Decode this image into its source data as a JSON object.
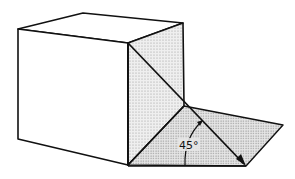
{
  "diagram": {
    "type": "isometric-cube-with-shadow-plane",
    "angle_label": "45°",
    "colors": {
      "stroke": "#111111",
      "face_white": "#ffffff",
      "face_shaded": "#e2e2e2",
      "ground_shaded": "#d6d6d6"
    },
    "vertices": {
      "front_top_left": [
        18,
        29
      ],
      "back_top_left": [
        83,
        13
      ],
      "back_top_right": [
        183,
        23
      ],
      "front_top_right": [
        128,
        43
      ],
      "front_bottom_left": [
        18,
        139
      ],
      "front_bottom_right": [
        128,
        165
      ],
      "back_bottom_right": [
        184,
        106
      ],
      "ground_far_right": [
        283,
        125
      ],
      "ground_near_right": [
        246,
        166
      ]
    }
  }
}
